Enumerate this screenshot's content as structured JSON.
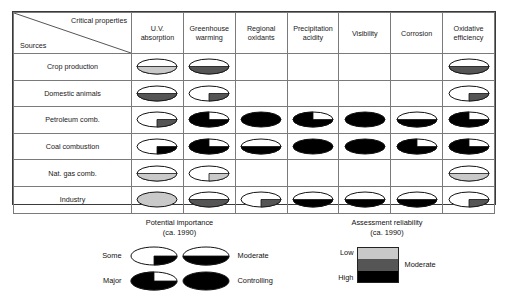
{
  "matrix": {
    "corner": {
      "column_axis_label": "Critical properties",
      "row_axis_label": "Sources"
    },
    "columns": [
      {
        "line1": "U.V.",
        "line2": "absorption"
      },
      {
        "line1": "Greenhouse",
        "line2": "warming"
      },
      {
        "line1": "Regional",
        "line2": "oxidants"
      },
      {
        "line1": "Precipitation",
        "line2": "acidity"
      },
      {
        "line1": "Visibility",
        "line2": ""
      },
      {
        "line1": "Corrosion",
        "line2": ""
      },
      {
        "line1": "Oxidative",
        "line2": "efficiency"
      }
    ],
    "rows": [
      {
        "label": "Crop production"
      },
      {
        "label": "Domestic animals"
      },
      {
        "label": "Petroleum comb."
      },
      {
        "label": "Coal combustion"
      },
      {
        "label": "Nat. gas comb."
      },
      {
        "label": "Industry"
      }
    ]
  },
  "chart_data": {
    "type": "heatmap",
    "xlabel": "Critical properties",
    "ylabel": "Sources",
    "categories_x": [
      "U.V. absorption",
      "Greenhouse warming",
      "Regional oxidants",
      "Precipitation acidity",
      "Visibility",
      "Corrosion",
      "Oxidative efficiency"
    ],
    "categories_y": [
      "Crop production",
      "Domestic animals",
      "Petroleum comb.",
      "Coal combustion",
      "Nat. gas comb.",
      "Industry"
    ],
    "importance_scale": [
      "none",
      "some",
      "moderate",
      "major",
      "controlling"
    ],
    "importance_fraction": {
      "none": 0,
      "some": 0.25,
      "moderate": 0.5,
      "major": 0.75,
      "controlling": 1
    },
    "reliability_scale": [
      "low",
      "moderate",
      "high"
    ],
    "reliability_color": {
      "low": "#c9c9c9",
      "moderate": "#555555",
      "high": "#000000"
    },
    "cells": [
      [
        {
          "importance": "moderate",
          "reliability": "low"
        },
        {
          "importance": "moderate",
          "reliability": "moderate"
        },
        {
          "importance": "none",
          "reliability": "none"
        },
        {
          "importance": "none",
          "reliability": "none"
        },
        {
          "importance": "none",
          "reliability": "none"
        },
        {
          "importance": "none",
          "reliability": "none"
        },
        {
          "importance": "moderate",
          "reliability": "moderate"
        }
      ],
      [
        {
          "importance": "moderate",
          "reliability": "moderate"
        },
        {
          "importance": "some",
          "reliability": "moderate"
        },
        {
          "importance": "none",
          "reliability": "none"
        },
        {
          "importance": "none",
          "reliability": "none"
        },
        {
          "importance": "none",
          "reliability": "none"
        },
        {
          "importance": "none",
          "reliability": "none"
        },
        {
          "importance": "some",
          "reliability": "moderate"
        }
      ],
      [
        {
          "importance": "some",
          "reliability": "moderate"
        },
        {
          "importance": "major",
          "reliability": "high"
        },
        {
          "importance": "controlling",
          "reliability": "high"
        },
        {
          "importance": "major",
          "reliability": "high"
        },
        {
          "importance": "controlling",
          "reliability": "high"
        },
        {
          "importance": "moderate",
          "reliability": "high"
        },
        {
          "importance": "major",
          "reliability": "high"
        }
      ],
      [
        {
          "importance": "some",
          "reliability": "high"
        },
        {
          "importance": "major",
          "reliability": "high"
        },
        {
          "importance": "moderate",
          "reliability": "high"
        },
        {
          "importance": "controlling",
          "reliability": "high"
        },
        {
          "importance": "controlling",
          "reliability": "high"
        },
        {
          "importance": "major",
          "reliability": "high"
        },
        {
          "importance": "major",
          "reliability": "high"
        }
      ],
      [
        {
          "importance": "moderate",
          "reliability": "low"
        },
        {
          "importance": "some",
          "reliability": "low"
        },
        {
          "importance": "none",
          "reliability": "none"
        },
        {
          "importance": "none",
          "reliability": "none"
        },
        {
          "importance": "none",
          "reliability": "none"
        },
        {
          "importance": "none",
          "reliability": "none"
        },
        {
          "importance": "moderate",
          "reliability": "low"
        }
      ],
      [
        {
          "importance": "controlling",
          "reliability": "low"
        },
        {
          "importance": "moderate",
          "reliability": "moderate"
        },
        {
          "importance": "some",
          "reliability": "moderate"
        },
        {
          "importance": "moderate",
          "reliability": "high"
        },
        {
          "importance": "moderate",
          "reliability": "high"
        },
        {
          "importance": "moderate",
          "reliability": "high"
        },
        {
          "importance": "some",
          "reliability": "moderate"
        }
      ]
    ]
  },
  "legend_importance": {
    "title": "Potential importance",
    "subtitle": "(ca. 1990)",
    "items": [
      {
        "label": "Some",
        "fraction": 0.25
      },
      {
        "label": "Moderate",
        "fraction": 0.5
      },
      {
        "label": "Major",
        "fraction": 0.75
      },
      {
        "label": "Controlling",
        "fraction": 1
      }
    ]
  },
  "legend_reliability": {
    "title": "Assessment reliability",
    "subtitle": "(ca. 1990)",
    "label_low": "Low",
    "label_high": "High",
    "label_moderate": "Moderate",
    "band_colors": [
      "#c9c9c9",
      "#555555",
      "#000000"
    ]
  }
}
